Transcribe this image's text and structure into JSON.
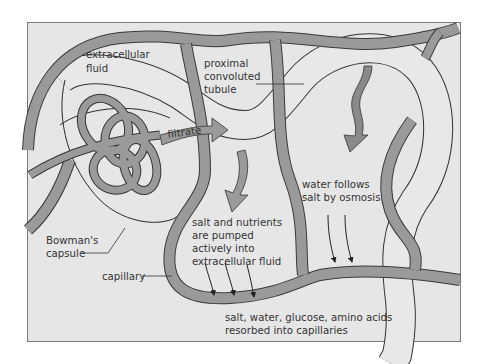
{
  "diagram": {
    "colors": {
      "background": "#e6e6e6",
      "frame": "#7a7a7a",
      "capillary": "#9a9a9a",
      "tubule_fill": "#e8e8e8",
      "outline": "#333333",
      "text": "#333333"
    },
    "labels": {
      "extracellular_fluid": [
        "extracellular",
        "fluid"
      ],
      "proximal_tubule": [
        "proximal",
        "convoluted",
        "tubule"
      ],
      "filtrate": "filtrate",
      "bowmans_capsule": [
        "Bowman's",
        "capsule"
      ],
      "capillary": "capillary",
      "salt_nutrients": [
        "salt and nutrients",
        "are pumped",
        "actively into",
        "extracellular fluid"
      ],
      "water_follows": [
        "water follows",
        "salt by osmosis"
      ],
      "resorbed": [
        "salt, water, glucose, amino acids",
        "resorbed into capillaries"
      ]
    }
  }
}
